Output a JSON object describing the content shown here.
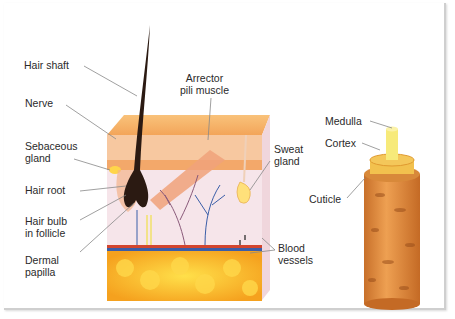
{
  "diagram": {
    "colors": {
      "hair": "#2b1a12",
      "epidermis": "#f6b56a",
      "dermis": "#f7e6ea",
      "fat": "#f5a623",
      "fat_highlight": "#ffd24a",
      "vein": "#3b5ea8",
      "artery": "#c0392b",
      "cuticle": "#e08a3a",
      "cortex": "#f2c14e",
      "medulla": "#f7ea7a",
      "leader_line": "#888888"
    },
    "skin_labels": {
      "hair_shaft": "Hair shaft",
      "nerve": "Nerve",
      "sebaceous_gland": "Sebaceous\ngland",
      "hair_root": "Hair root",
      "hair_bulb": "Hair bulb\nin follicle",
      "dermal_papilla": "Dermal\npapilla",
      "arrector_pili": "Arrector\npili muscle",
      "sweat_gland": "Sweat\ngland",
      "blood_vessels": "Blood\nvessels"
    },
    "hair_labels": {
      "medulla": "Medulla",
      "cortex": "Cortex",
      "cuticle": "Cuticle"
    }
  }
}
